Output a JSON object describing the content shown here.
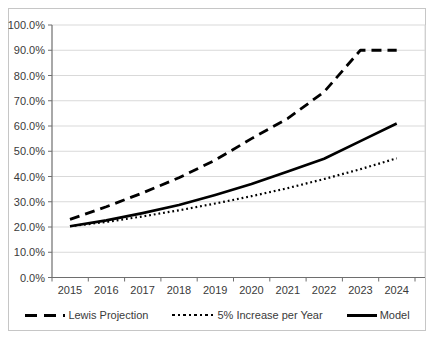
{
  "chart_data": {
    "type": "line",
    "title": "",
    "xlabel": "",
    "ylabel": "",
    "categories": [
      "2015",
      "2016",
      "2017",
      "2018",
      "2019",
      "2020",
      "2021",
      "2022",
      "2023",
      "2024"
    ],
    "series": [
      {
        "name": "Lewis Projection",
        "line_style": "dashed",
        "values": [
          23.0,
          28.0,
          33.5,
          39.5,
          46.5,
          55.0,
          63.0,
          73.5,
          90.0,
          90.0
        ]
      },
      {
        "name": "5% Increase per Year",
        "line_style": "dotted",
        "values": [
          20.3,
          22.0,
          24.2,
          26.6,
          29.3,
          32.2,
          35.4,
          39.0,
          42.9,
          47.2
        ]
      },
      {
        "name": "Model",
        "line_style": "solid",
        "values": [
          20.3,
          22.6,
          25.5,
          28.7,
          32.7,
          37.0,
          42.0,
          47.0,
          54.0,
          61.0
        ]
      }
    ],
    "ylim": [
      0,
      100
    ],
    "yticks": [
      0,
      10,
      20,
      30,
      40,
      50,
      60,
      70,
      80,
      90,
      100
    ],
    "ytick_labels": [
      "0.0%",
      "10.0%",
      "20.0%",
      "30.0%",
      "40.0%",
      "50.0%",
      "60.0%",
      "70.0%",
      "80.0%",
      "90.0%",
      "100.0%"
    ],
    "grid": true,
    "legend_position": "bottom",
    "colors": {
      "line": "#000000",
      "grid": "#d9d9d9",
      "axis": "#6e6e6e",
      "text": "#3a3a3a",
      "frame_border": "#c6c6c6",
      "background": "#ffffff"
    }
  }
}
